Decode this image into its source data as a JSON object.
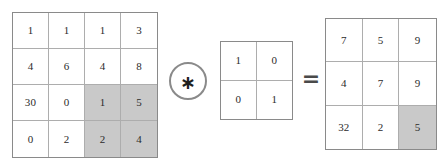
{
  "chart_data": {
    "type": "diagram",
    "operators": {
      "convolution_symbol": "∗",
      "convolution_icon": "asterisk-in-circle-icon",
      "equals_symbol": "=",
      "equals_icon": "equals-icon"
    },
    "colors": {
      "highlight_fill": "#c9c9c9",
      "cell_fill": "#ffffff",
      "outer_border": "#8a8a8a",
      "inner_border": "#adadad",
      "text": "#2b2b2b",
      "background": "#ffffff"
    },
    "matrices": [
      {
        "name": "input",
        "rows": 4,
        "cols": 4,
        "values": [
          [
            "1",
            "1",
            "1",
            "3"
          ],
          [
            "4",
            "6",
            "4",
            "8"
          ],
          [
            "30",
            "0",
            "1",
            "5"
          ],
          [
            "0",
            "2",
            "2",
            "4"
          ]
        ],
        "highlighted": [
          [
            2,
            2
          ],
          [
            2,
            3
          ],
          [
            3,
            2
          ],
          [
            3,
            3
          ]
        ]
      },
      {
        "name": "kernel",
        "rows": 2,
        "cols": 2,
        "values": [
          [
            "1",
            "0"
          ],
          [
            "0",
            "1"
          ]
        ],
        "highlighted": []
      },
      {
        "name": "output",
        "rows": 3,
        "cols": 3,
        "values": [
          [
            "7",
            "5",
            "9"
          ],
          [
            "4",
            "7",
            "9"
          ],
          [
            "32",
            "2",
            "5"
          ]
        ],
        "highlighted": [
          [
            2,
            2
          ]
        ]
      }
    ]
  },
  "input_matrix": {
    "label": "input-matrix",
    "rows": [
      [
        "1",
        "1",
        "1",
        "3"
      ],
      [
        "4",
        "6",
        "4",
        "8"
      ],
      [
        "30",
        "0",
        "1",
        "5"
      ],
      [
        "0",
        "2",
        "2",
        "4"
      ]
    ],
    "highlighted": [
      [
        2,
        2
      ],
      [
        2,
        3
      ],
      [
        3,
        2
      ],
      [
        3,
        3
      ]
    ]
  },
  "kernel_matrix": {
    "label": "kernel-matrix",
    "rows": [
      [
        "1",
        "0"
      ],
      [
        "0",
        "1"
      ]
    ],
    "highlighted": []
  },
  "output_matrix": {
    "label": "output-matrix",
    "rows": [
      [
        "7",
        "5",
        "9"
      ],
      [
        "4",
        "7",
        "9"
      ],
      [
        "32",
        "2",
        "5"
      ]
    ],
    "highlighted": [
      [
        2,
        2
      ]
    ]
  },
  "operators": {
    "convolution": "∗",
    "equals": "="
  }
}
